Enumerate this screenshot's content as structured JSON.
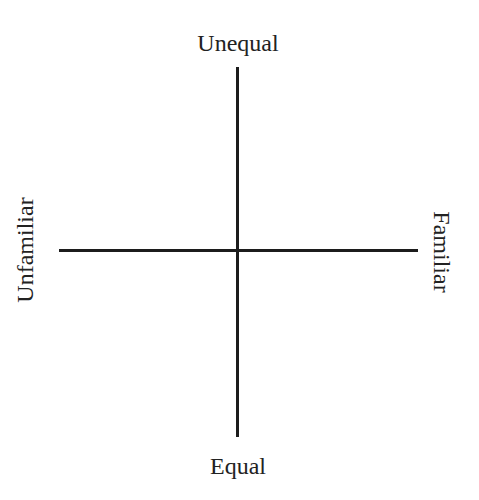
{
  "diagram": {
    "type": "quadrant-axes",
    "axes": {
      "vertical": {
        "top_label": "Unequal",
        "bottom_label": "Equal"
      },
      "horizontal": {
        "left_label": "Unfamiliar",
        "right_label": "Familiar"
      }
    },
    "colors": {
      "line": "#1c1c1c",
      "text": "#222222",
      "background": "#ffffff"
    }
  }
}
